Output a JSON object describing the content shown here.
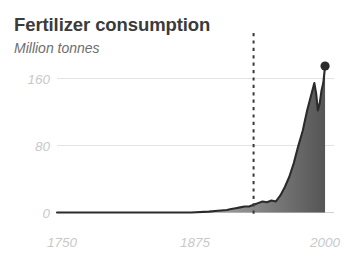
{
  "chart_data": {
    "type": "area",
    "title": "Fertilizer consumption",
    "subtitle": "Million tonnes",
    "xlabel": "",
    "ylabel": "Million tonnes",
    "xlim": [
      1700,
      2010
    ],
    "ylim": [
      0,
      185
    ],
    "grid": true,
    "grid_axis": "y",
    "legend": "none",
    "yticks": [
      0,
      80,
      160
    ],
    "ytick_labels": [
      "0",
      "80",
      "160"
    ],
    "xticks": [
      1750,
      1875,
      2000
    ],
    "xtick_labels": [
      "1750",
      "1875",
      "2000"
    ],
    "annotations": [
      {
        "type": "vertical-dashed-line",
        "x": 1920,
        "label": ""
      },
      {
        "type": "end-point-marker",
        "x": 2000,
        "y": 172
      }
    ],
    "series": [
      {
        "name": "Fertilizer consumption",
        "line_color": "#2b2b2b",
        "fill": "gradient",
        "fill_from": "#f2f2f2",
        "fill_to": "#575757",
        "x": [
          1700,
          1750,
          1800,
          1850,
          1870,
          1880,
          1890,
          1895,
          1900,
          1905,
          1910,
          1915,
          1920,
          1925,
          1930,
          1935,
          1940,
          1945,
          1950,
          1955,
          1960,
          1965,
          1970,
          1975,
          1980,
          1985,
          1988,
          1990,
          1992,
          1994,
          1996,
          1998,
          2000
        ],
        "values": [
          0,
          0,
          0,
          0,
          1,
          2,
          3,
          4,
          5,
          6,
          7,
          7,
          9,
          11,
          13,
          12,
          14,
          13,
          20,
          30,
          42,
          58,
          78,
          96,
          120,
          140,
          152,
          140,
          120,
          128,
          143,
          152,
          172
        ]
      }
    ]
  },
  "colors": {
    "title": "#3b3b3b",
    "subtitle": "#6e6e6e",
    "tick": "#c9c9c9",
    "gridline": "#e0e0e0",
    "line": "#2b2b2b",
    "dashed": "#333333",
    "background": "#ffffff"
  }
}
